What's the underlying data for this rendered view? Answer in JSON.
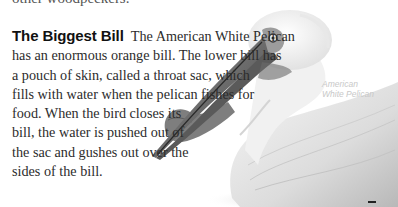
{
  "previous_text": {
    "cut_off_line": "other woodpeckers."
  },
  "article": {
    "heading": "The Biggest Bill",
    "lines": [
      "The American White Pelican",
      "has an enormous orange bill. The lower bill has",
      "a pouch of skin, called a throat sac, which",
      "fills with water when the pelican fishes for",
      "food. When the bird closes its",
      "bill, the water is pushed out of",
      "the sac and gushes out over the",
      "sides of the bill."
    ]
  },
  "figure": {
    "caption_line1": "American",
    "caption_line2": "White Pelican"
  }
}
